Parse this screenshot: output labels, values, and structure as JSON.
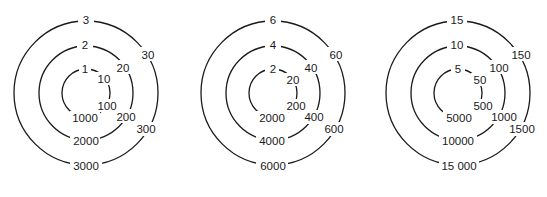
{
  "diagrams": [
    {
      "name": "dial-1",
      "rings": [
        {
          "top": "1",
          "upper_right": "10",
          "lower_right": "100",
          "bottom": "1000"
        },
        {
          "top": "2",
          "upper_right": "20",
          "lower_right": "200",
          "bottom": "2000"
        },
        {
          "top": "3",
          "upper_right": "30",
          "lower_right": "300",
          "bottom": "3000"
        }
      ]
    },
    {
      "name": "dial-2",
      "rings": [
        {
          "top": "2",
          "upper_right": "20",
          "lower_right": "200",
          "bottom": "2000"
        },
        {
          "top": "4",
          "upper_right": "40",
          "lower_right": "400",
          "bottom": "4000"
        },
        {
          "top": "6",
          "upper_right": "60",
          "lower_right": "600",
          "bottom": "6000"
        }
      ]
    },
    {
      "name": "dial-3",
      "rings": [
        {
          "top": "5",
          "upper_right": "50",
          "lower_right": "500",
          "bottom": "5000"
        },
        {
          "top": "10",
          "upper_right": "100",
          "lower_right": "1000",
          "bottom": "10000"
        },
        {
          "top": "15",
          "upper_right": "150",
          "lower_right": "1500",
          "bottom": "15 000"
        }
      ]
    }
  ]
}
